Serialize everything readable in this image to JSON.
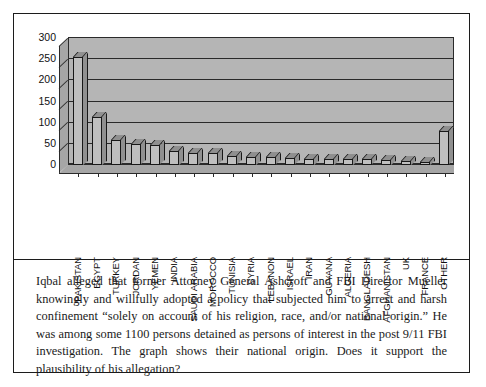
{
  "figure": {
    "has_outer_frame": true,
    "frame_color": "#1c1c1c",
    "background": "#ffffff"
  },
  "chart_data": {
    "type": "bar",
    "title": "",
    "subtitle": "",
    "xlabel": "",
    "ylabel": "",
    "ylim": [
      0,
      300
    ],
    "yticks": [
      0,
      50,
      100,
      150,
      200,
      250,
      300
    ],
    "grid": true,
    "legend": false,
    "style_3d": true,
    "bar_face_color": "#bfbfbf",
    "plot_background": "#b5b5b5",
    "categories": [
      "PAKISTAN",
      "EGYPT",
      "TURKEY",
      "JORDAN",
      "YEMEN",
      "INDIA",
      "SAUDI ARABIA",
      "MOROCCO",
      "TUNISIA",
      "SYRIA",
      "LEBANON",
      "ISRAEL",
      "IRAN",
      "GUYANA",
      "ALGERIA",
      "BANGLADESH",
      "AFGHANISTAN",
      "UK",
      "FRANCE",
      "OTHER"
    ],
    "values": [
      254,
      113,
      57,
      48,
      46,
      32,
      28,
      27,
      19,
      18,
      17,
      15,
      14,
      13,
      13,
      12,
      11,
      9,
      7,
      78
    ]
  },
  "prose": {
    "paragraph": "Iqbal alleged that former Attorney General Ashcroft and FBI Director Mueller knowingly and willfully adopted a policy that subjected him to arrest and harsh confinement “solely on account of his religion, race, and/or national origin.” He was among some 1100 persons detained as persons of interest in the post 9/11 FBI investigation.  The graph shows their national origin. Does it support the plausibility of his allegation?"
  }
}
